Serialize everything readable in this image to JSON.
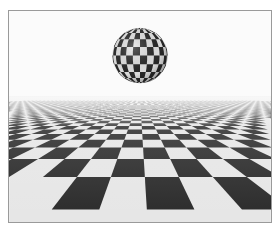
{
  "image": {
    "description": "Rendered 3D scene: checkered sphere floating above an infinite checkered plane",
    "colors": {
      "background": "#fbfbfb",
      "frame_border": "#9a9a9a",
      "dark_tile": "#2a2a2a",
      "light_tile": "#e6e6e6"
    },
    "sphere": {
      "cx": 132,
      "cy": 45,
      "r": 28,
      "rows": 10,
      "cols": 12
    },
    "plane": {
      "horizon_y": 86,
      "cols": 40,
      "rows": 14
    }
  }
}
